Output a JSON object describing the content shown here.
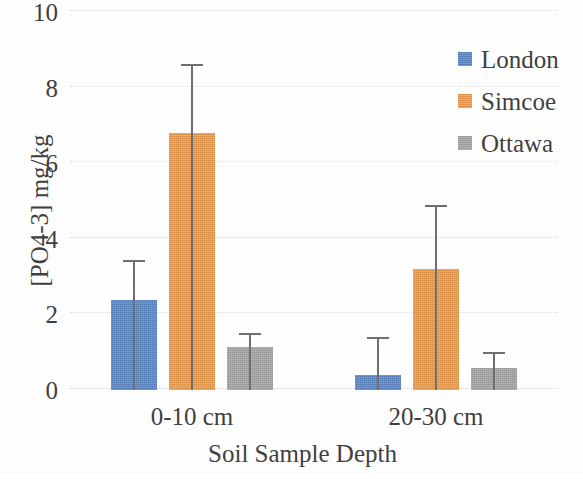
{
  "chart_data": {
    "type": "bar",
    "title": "",
    "xlabel": "Soil Sample Depth",
    "ylabel": "[PO4-3] mg/kg",
    "categories": [
      "0-10 cm",
      "20-30 cm"
    ],
    "ylim": [
      0,
      10
    ],
    "yticks": [
      0,
      2,
      4,
      6,
      8,
      10
    ],
    "ytick_labels": [
      "0",
      "2",
      "4",
      "6",
      "8",
      "10"
    ],
    "grid": true,
    "grid_axis": "y",
    "legend_position": "right",
    "error_bars": "upper-only",
    "series": [
      {
        "name": "London",
        "color": "#5B89C4",
        "values": [
          2.38,
          0.4
        ],
        "error_upper": [
          1.02,
          0.98
        ],
        "error_top_values": [
          3.4,
          1.38
        ]
      },
      {
        "name": "Simcoe",
        "color": "#ED9C4E",
        "values": [
          6.8,
          3.2
        ],
        "error_upper": [
          1.8,
          1.67
        ],
        "error_top_values": [
          8.6,
          4.87
        ]
      },
      {
        "name": "Ottawa",
        "color": "#A5A5A5",
        "values": [
          1.14,
          0.58
        ],
        "error_upper": [
          0.34,
          0.4
        ],
        "error_top_values": [
          1.48,
          0.98
        ]
      }
    ]
  },
  "axes": {
    "y_label": "[PO4-3] mg/kg",
    "x_label": "Soil Sample Depth",
    "y_tick_0": "0",
    "y_tick_1": "2",
    "y_tick_2": "4",
    "y_tick_3": "6",
    "y_tick_4": "8",
    "y_tick_5": "10",
    "x_tick_0": "0-10 cm",
    "x_tick_1": "20-30 cm"
  },
  "legend": {
    "items": [
      {
        "label": "London",
        "color": "#5B89C4"
      },
      {
        "label": "Simcoe",
        "color": "#ED9C4E"
      },
      {
        "label": "Ottawa",
        "color": "#A5A5A5"
      }
    ]
  }
}
